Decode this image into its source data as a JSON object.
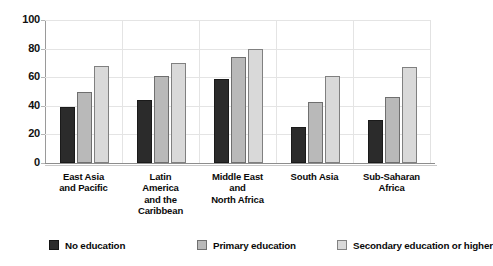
{
  "crop_remnant_text": "",
  "chart_data": {
    "type": "bar",
    "title": "",
    "subtitle": "",
    "xlabel": "",
    "ylabel": "",
    "ylim": [
      0,
      100
    ],
    "ytick_labels": [
      "100",
      "80",
      "60",
      "40",
      "20",
      "0"
    ],
    "ytick_values": [
      100,
      80,
      60,
      40,
      20,
      0
    ],
    "grid": "horizontal-and-vertical-light",
    "legend_position": "bottom",
    "categories": [
      "East Asia\nand Pacific",
      "Latin\nAmerica\nand the\nCaribbean",
      "Middle East\nand\nNorth Africa",
      "South Asia",
      "Sub-Saharan\nAfrica"
    ],
    "category_lines": [
      [
        "East Asia",
        "and Pacific"
      ],
      [
        "Latin",
        "America",
        "and the",
        "Caribbean"
      ],
      [
        "Middle East",
        "and",
        "North Africa"
      ],
      [
        "South Asia"
      ],
      [
        "Sub-Saharan",
        "Africa"
      ]
    ],
    "series": [
      {
        "name": "No education",
        "color": "#2b2b2b",
        "values": [
          39,
          44,
          59,
          25,
          30
        ]
      },
      {
        "name": "Primary education",
        "color": "#b9b9b9",
        "values": [
          50,
          61,
          74,
          43,
          46
        ]
      },
      {
        "name": "Secondary education or higher",
        "color": "#d9d9d9",
        "values": [
          68,
          70,
          80,
          61,
          67
        ]
      }
    ]
  },
  "legend": {
    "items": [
      {
        "label": "No education",
        "swatch": "s0"
      },
      {
        "label": "Primary education",
        "swatch": "s1"
      },
      {
        "label": "Secondary education or higher",
        "swatch": "s2"
      }
    ]
  }
}
